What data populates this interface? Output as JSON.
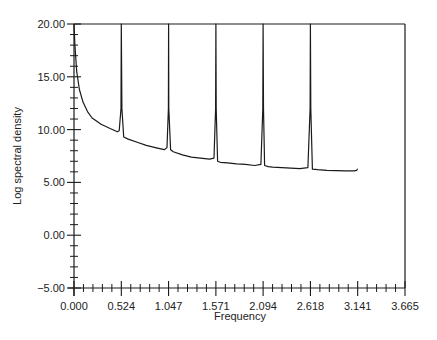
{
  "chart_data": {
    "type": "line",
    "title": "",
    "xlabel": "Frequency",
    "ylabel": "Log spectral density",
    "xlim": [
      0.0,
      3.665
    ],
    "ylim": [
      -5.0,
      20.0
    ],
    "x_ticks": [
      "0.000",
      "0.524",
      "1.047",
      "1.571",
      "2.094",
      "2.618",
      "3.141",
      "3.665"
    ],
    "x_tick_values": [
      0.0,
      0.524,
      1.047,
      1.571,
      2.094,
      2.618,
      3.141,
      3.665
    ],
    "y_ticks": [
      "-5.00",
      "0.00",
      "5.00",
      "10.00",
      "15.00",
      "20.00"
    ],
    "y_tick_values": [
      -5,
      0,
      5,
      10,
      15,
      20
    ],
    "x_minor_per_major": 5,
    "y_minor_per_major": 5,
    "grid": false,
    "legend": null,
    "annotations": [],
    "peaks_x": [
      0.524,
      1.047,
      1.571,
      2.094,
      2.618
    ],
    "series": [
      {
        "name": "log spectral density",
        "x": [
          0.0,
          0.01,
          0.03,
          0.06,
          0.1,
          0.15,
          0.2,
          0.3,
          0.4,
          0.48,
          0.5,
          0.52,
          0.524,
          0.53,
          0.55,
          0.6,
          0.7,
          0.8,
          0.9,
          1.0,
          1.03,
          1.045,
          1.047,
          1.05,
          1.07,
          1.1,
          1.2,
          1.3,
          1.4,
          1.5,
          1.55,
          1.568,
          1.571,
          1.575,
          1.59,
          1.62,
          1.7,
          1.8,
          1.9,
          2.0,
          2.07,
          2.09,
          2.094,
          2.098,
          2.11,
          2.15,
          2.2,
          2.3,
          2.4,
          2.5,
          2.59,
          2.614,
          2.618,
          2.622,
          2.64,
          2.7,
          2.8,
          2.9,
          3.0,
          3.1,
          3.13,
          3.141
        ],
        "y": [
          20.0,
          18.0,
          15.5,
          13.8,
          12.6,
          11.7,
          11.1,
          10.5,
          10.1,
          9.8,
          9.9,
          12.0,
          20.0,
          12.0,
          9.3,
          9.1,
          8.8,
          8.5,
          8.3,
          8.1,
          8.3,
          12.0,
          20.0,
          12.0,
          8.1,
          7.9,
          7.6,
          7.4,
          7.3,
          7.2,
          7.3,
          12.0,
          20.0,
          12.0,
          7.0,
          6.9,
          6.85,
          6.75,
          6.7,
          6.6,
          6.7,
          12.0,
          20.0,
          12.0,
          6.6,
          6.5,
          6.45,
          6.4,
          6.35,
          6.3,
          6.4,
          12.0,
          20.0,
          12.0,
          6.25,
          6.2,
          6.15,
          6.12,
          6.1,
          6.1,
          6.15,
          6.3
        ]
      }
    ]
  }
}
